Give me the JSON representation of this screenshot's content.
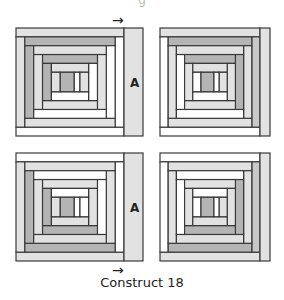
{
  "caption": "Construct 18",
  "top_fragment": "g",
  "strip_label": "A",
  "arrow_glyph": "→",
  "colors": {
    "outline": "#3a3a3a",
    "light": "#e2e2e2",
    "mid": "#c8c8c8",
    "dark": "#b4b4b4",
    "white": "#ffffff"
  },
  "blocks": [
    {
      "name": "block-top-left",
      "x": 16,
      "y": 28,
      "w": 108,
      "h": 108,
      "strip": {
        "x": 124,
        "y": 28,
        "w": 19,
        "h": 108,
        "fill": "light",
        "label": true
      },
      "rings": [
        {
          "top": "light",
          "right": "white",
          "bottom": "white",
          "left": "light"
        },
        {
          "top": "dark",
          "right": "white",
          "bottom": "light",
          "left": "dark"
        },
        {
          "top": "light",
          "right": "light",
          "bottom": "white",
          "left": "light"
        },
        {
          "top": "dark",
          "right": "white",
          "bottom": "light",
          "left": "dark"
        },
        {
          "top": "light",
          "right": "light",
          "bottom": "white",
          "left": "light"
        }
      ],
      "center": "dark",
      "center_side": "white"
    },
    {
      "name": "block-top-right",
      "x": 160,
      "y": 28,
      "w": 100,
      "h": 108,
      "strip": {
        "x": 260,
        "y": 28,
        "w": 10,
        "h": 108,
        "fill": "light",
        "label": false
      },
      "rings": [
        {
          "top": "light",
          "right": "mid",
          "bottom": "white",
          "left": "white"
        },
        {
          "top": "dark",
          "right": "light",
          "bottom": "light",
          "left": "light"
        },
        {
          "top": "light",
          "right": "dark",
          "bottom": "white",
          "left": "white"
        },
        {
          "top": "dark",
          "right": "light",
          "bottom": "light",
          "left": "light"
        },
        {
          "top": "light",
          "right": "light",
          "bottom": "white",
          "left": "white"
        }
      ],
      "center": "dark",
      "center_side": "white"
    },
    {
      "name": "block-bottom-left",
      "x": 16,
      "y": 153,
      "w": 108,
      "h": 108,
      "strip": {
        "x": 124,
        "y": 153,
        "w": 19,
        "h": 108,
        "fill": "light",
        "label": true
      },
      "rings": [
        {
          "top": "white",
          "right": "white",
          "bottom": "light",
          "left": "light"
        },
        {
          "top": "light",
          "right": "light",
          "bottom": "dark",
          "left": "dark"
        },
        {
          "top": "white",
          "right": "white",
          "bottom": "light",
          "left": "light"
        },
        {
          "top": "light",
          "right": "light",
          "bottom": "dark",
          "left": "dark"
        },
        {
          "top": "white",
          "right": "white",
          "bottom": "light",
          "left": "light"
        }
      ],
      "center": "dark",
      "center_side": "white"
    },
    {
      "name": "block-bottom-right",
      "x": 160,
      "y": 153,
      "w": 100,
      "h": 108,
      "strip": {
        "x": 260,
        "y": 153,
        "w": 10,
        "h": 108,
        "fill": "light",
        "label": false
      },
      "rings": [
        {
          "top": "white",
          "right": "mid",
          "bottom": "light",
          "left": "white"
        },
        {
          "top": "light",
          "right": "light",
          "bottom": "dark",
          "left": "light"
        },
        {
          "top": "white",
          "right": "dark",
          "bottom": "light",
          "left": "white"
        },
        {
          "top": "light",
          "right": "light",
          "bottom": "dark",
          "left": "light"
        },
        {
          "top": "white",
          "right": "light",
          "bottom": "light",
          "left": "white"
        }
      ],
      "center": "dark",
      "center_side": "white"
    }
  ],
  "arrows": [
    {
      "name": "arrow-top",
      "x": 112,
      "y": 13
    },
    {
      "name": "arrow-bottom",
      "x": 112,
      "y": 263
    }
  ],
  "labels": [
    {
      "name": "label-a-top",
      "x": 130,
      "y": 76
    },
    {
      "name": "label-a-bottom",
      "x": 130,
      "y": 201
    }
  ]
}
